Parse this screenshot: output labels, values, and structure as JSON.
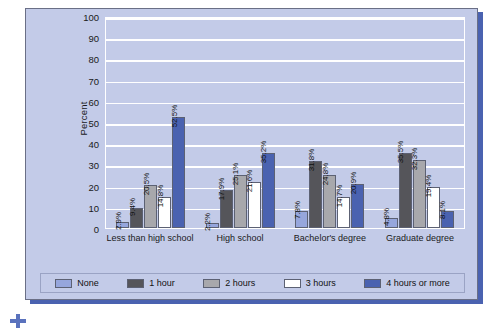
{
  "chart_data": {
    "type": "bar",
    "title": "",
    "xlabel": "",
    "ylabel": "Percent",
    "ylim": [
      0,
      100
    ],
    "yticks": [
      100,
      90,
      80,
      70,
      60,
      50,
      40,
      30,
      20,
      10,
      0
    ],
    "grid": true,
    "legend_position": "bottom",
    "categories": [
      "Less than high school",
      "High school",
      "Bachelor's degree",
      "Graduate degree"
    ],
    "series": [
      {
        "name": "None",
        "color": "#96a6dc",
        "values": [
          2.9,
          2.2,
          7.8,
          4.8
        ],
        "labels": [
          "2.9%",
          "2.2%",
          "7.8%",
          "4.8%"
        ]
      },
      {
        "name": "1 hour",
        "color": "#55555a",
        "values": [
          9.4,
          17.9,
          31.8,
          35.5
        ],
        "labels": [
          "9.4%",
          "17.9%",
          "31.8%",
          "35.5%"
        ]
      },
      {
        "name": "2 hours",
        "color": "#a8a8ac",
        "values": [
          20.5,
          25.1,
          24.8,
          32.3
        ],
        "labels": [
          "20.5%",
          "25.1%",
          "24.8%",
          "32.3%"
        ]
      },
      {
        "name": "3 hours",
        "color": "#ffffff",
        "values": [
          14.8,
          21.6,
          14.7,
          19.4
        ],
        "labels": [
          "14.8%",
          "21.6%",
          "14.7%",
          "19.4%"
        ]
      },
      {
        "name": "4 hours or more",
        "color": "#4a62b0",
        "values": [
          52.5,
          35.2,
          20.9,
          8.1
        ],
        "labels": [
          "52.5%",
          "35.2%",
          "20.9%",
          "8.1%"
        ]
      }
    ]
  },
  "theme": {
    "panel_background": "#c3cbe8",
    "plot_background": "#c3cbe8",
    "gridline_color": "#ffffff",
    "shadow_color": "#4a62b0",
    "text_color": "#1a1a1a"
  }
}
